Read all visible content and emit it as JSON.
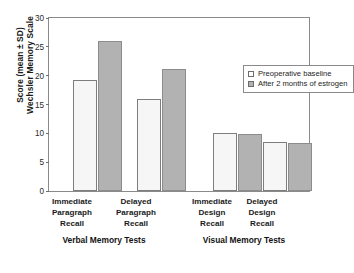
{
  "chart_data": {
    "type": "bar",
    "title": "",
    "subtitle": "",
    "xlabel": "",
    "ylabel": "Score (mean ± SD) Wechsler Memory Scale",
    "ylabel_lines": [
      "Score (mean ± SD)",
      "Wechsler Memory Scale"
    ],
    "ylim": [
      0,
      30
    ],
    "yticks": [
      0,
      5,
      10,
      15,
      20,
      25,
      30
    ],
    "grid": false,
    "legend_position": "upper right inside",
    "categories": [
      "Immediate Paragraph Recall",
      "Delayed Paragraph Recall",
      "Immediate Design Recall",
      "Delayed Design Recall"
    ],
    "category_lines": [
      [
        "Immediate",
        "Paragraph",
        "Recall"
      ],
      [
        "Delayed",
        "Paragraph",
        "Recall"
      ],
      [
        "Immediate",
        "Design",
        "Recall"
      ],
      [
        "Delayed",
        "Design",
        "Recall"
      ]
    ],
    "series": [
      {
        "name": "Preoperative baseline",
        "color": "#f6f6f6",
        "values": [
          19.0,
          15.8,
          9.9,
          8.4
        ]
      },
      {
        "name": "After 2 months of estrogen",
        "color": "#b2b2b2",
        "values": [
          25.7,
          21.0,
          9.8,
          8.2
        ]
      }
    ],
    "groups": [
      {
        "label": "Verbal Memory Tests",
        "categories": [
          0,
          1
        ]
      },
      {
        "label": "Visual Memory Tests",
        "categories": [
          2,
          3
        ]
      }
    ],
    "annotations": []
  },
  "axis": {
    "tick_labels": [
      "30",
      "25",
      "20",
      "15",
      "10",
      "5",
      "0"
    ]
  },
  "legend": {
    "items": [
      {
        "label": "Preoperative baseline"
      },
      {
        "label": "After 2 months of estrogen"
      }
    ]
  },
  "groups": {
    "verbal": "Verbal Memory Tests",
    "visual": "Visual Memory Tests"
  }
}
